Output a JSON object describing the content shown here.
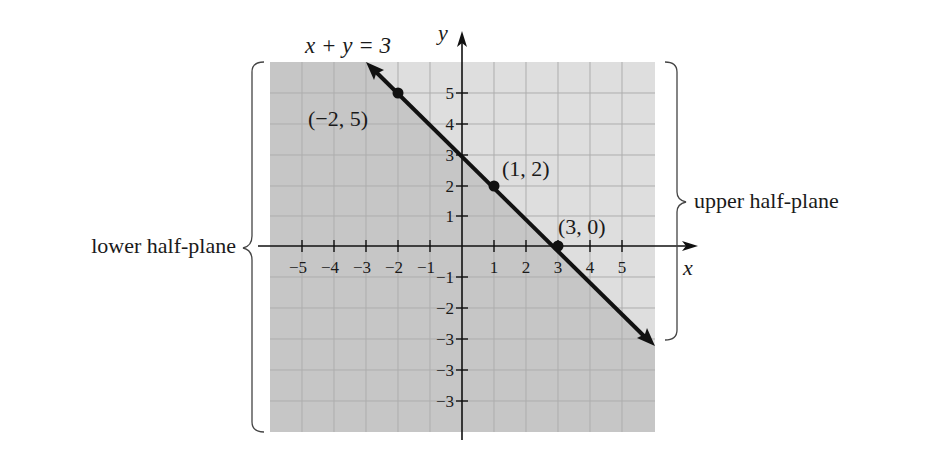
{
  "figure": {
    "equation_label": "x + y = 3",
    "x_axis_label": "x",
    "y_axis_label": "y",
    "x_tick_labels": [
      "−5",
      "−4",
      "−3",
      "−2",
      "−1",
      "1",
      "2",
      "3",
      "4",
      "5"
    ],
    "y_tick_labels_positive": [
      "1",
      "2",
      "3",
      "4",
      "5"
    ],
    "y_tick_labels_negative": [
      "−1",
      "−2",
      "−3",
      "−3",
      "−3"
    ],
    "points": [
      {
        "label": "(−2, 5)",
        "x": -2,
        "y": 5
      },
      {
        "label": "(1, 2)",
        "x": 1,
        "y": 2
      },
      {
        "label": "(3, 0)",
        "x": 3,
        "y": 0
      }
    ],
    "regions": {
      "lower": "lower half-plane",
      "upper": "upper half-plane"
    },
    "colors": {
      "lower_shade": "#c4c4c4",
      "upper_shade": "#dedede",
      "grid": "#b0b0b0",
      "line": "#111111"
    }
  }
}
